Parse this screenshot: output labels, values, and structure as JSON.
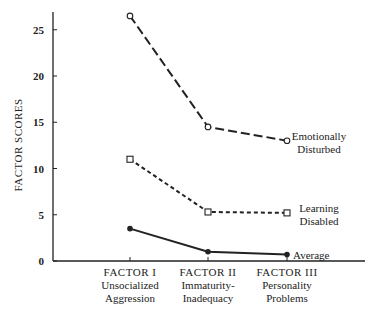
{
  "chart_data": {
    "type": "line",
    "title": "",
    "xlabel": "",
    "ylabel": "FACTOR SCORES",
    "ylim": [
      0,
      27
    ],
    "yticks": [
      0,
      5,
      10,
      15,
      20,
      25
    ],
    "grid": false,
    "legend_position": "inline-right",
    "categories": [
      [
        "FACTOR I",
        "Unsocialized",
        "Aggression"
      ],
      [
        "FACTOR II",
        "Immaturity-",
        "Inadequacy"
      ],
      [
        "FACTOR III",
        "Personality",
        "Problems"
      ]
    ],
    "series": [
      {
        "name": "Emotionally Disturbed",
        "label_lines": [
          "Emotionally",
          "Disturbed"
        ],
        "values": [
          26.5,
          14.5,
          13.0
        ],
        "line_style": "long-dash",
        "marker": "open-circle"
      },
      {
        "name": "Learning Disabled",
        "label_lines": [
          "Learning",
          "Disabled"
        ],
        "values": [
          11.0,
          5.3,
          5.2
        ],
        "line_style": "short-dash",
        "marker": "open-square"
      },
      {
        "name": "Average",
        "label_lines": [
          "Average"
        ],
        "values": [
          3.5,
          1.0,
          0.7
        ],
        "line_style": "solid",
        "marker": "filled-circle"
      }
    ]
  }
}
